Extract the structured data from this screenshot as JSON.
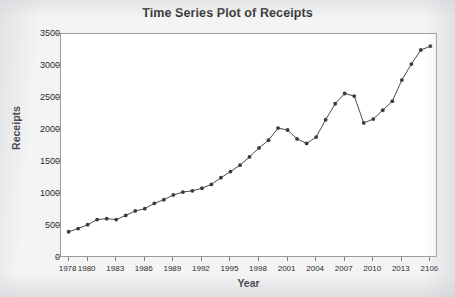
{
  "chart_data": {
    "type": "line",
    "title": "Time Series Plot of Receipts",
    "xlabel": "Year",
    "ylabel": "Receipts",
    "xlim": [
      1977.2,
      2016.8
    ],
    "ylim": [
      0,
      3500
    ],
    "grid": false,
    "legend": null,
    "marker": "filled-circle",
    "line_color": "#4a4a55",
    "marker_color": "#3a3a42",
    "ytick_labels": [
      "0",
      "500",
      "1000",
      "1500",
      "2000",
      "2500",
      "3000",
      "3500"
    ],
    "ytick_values": [
      0,
      500,
      1000,
      1500,
      2000,
      2500,
      3000,
      3500
    ],
    "xtick_labels": [
      "1978",
      "1980",
      "1983",
      "1986",
      "1989",
      "1992",
      "1995",
      "1998",
      "2001",
      "2004",
      "2007",
      "2010",
      "2013",
      "2106"
    ],
    "xtick_values": [
      1978,
      1980,
      1983,
      1986,
      1989,
      1992,
      1995,
      1998,
      2001,
      2004,
      2007,
      2010,
      2013,
      2016
    ],
    "x": [
      1978,
      1979,
      1980,
      1981,
      1982,
      1983,
      1984,
      1985,
      1986,
      1987,
      1988,
      1989,
      1990,
      1991,
      1992,
      1993,
      1994,
      1995,
      1996,
      1997,
      1998,
      1999,
      2000,
      2001,
      2002,
      2003,
      2004,
      2005,
      2006,
      2007,
      2008,
      2009,
      2010,
      2011,
      2012,
      2013,
      2014,
      2015,
      2016
    ],
    "values": [
      410,
      460,
      520,
      600,
      615,
      600,
      665,
      735,
      770,
      855,
      910,
      985,
      1030,
      1050,
      1090,
      1150,
      1255,
      1350,
      1450,
      1580,
      1720,
      1840,
      2030,
      2000,
      1860,
      1790,
      1890,
      2160,
      2410,
      2570,
      2530,
      2110,
      2170,
      2310,
      2450,
      2780,
      3030,
      3250,
      3310
    ],
    "series_name": "Receipts"
  }
}
